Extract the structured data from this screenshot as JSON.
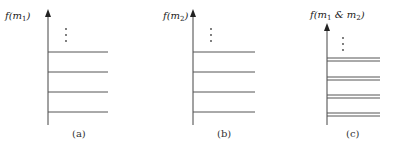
{
  "panels": [
    {
      "id": "a",
      "caption": "(a)",
      "axis_label": "f(m",
      "axis_label_sub": "1",
      "axis_label_end": ")",
      "levels": "single",
      "line_count": 4
    },
    {
      "id": "b",
      "caption": "(b)",
      "axis_label": "f(m",
      "axis_label_sub": "2",
      "axis_label_end": ")",
      "levels": "single",
      "line_count": 4
    },
    {
      "id": "c",
      "caption": "(c)",
      "axis_label": "f(m",
      "axis_label_sub": "1",
      "axis_label_mid": " & m",
      "axis_label_sub2": "2",
      "axis_label_end": ")",
      "levels": "double",
      "line_count": 4
    }
  ],
  "ellipsis": "⋮",
  "colors": {
    "line": "#555555",
    "text": "#222222"
  }
}
